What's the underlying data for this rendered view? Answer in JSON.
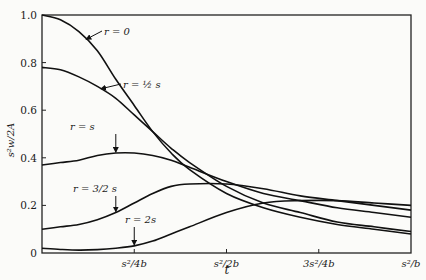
{
  "chart_data": {
    "type": "line",
    "title": "",
    "xlabel": "t",
    "ylabel": "s²w/2A",
    "xlim": [
      0,
      1
    ],
    "ylim": [
      0,
      1.0
    ],
    "x_unit": "s²/b",
    "grid": false,
    "y_ticks": [
      {
        "value": 0,
        "label": "0"
      },
      {
        "value": 0.2,
        "label": "0.2"
      },
      {
        "value": 0.4,
        "label": "0.4"
      },
      {
        "value": 0.6,
        "label": "0.6"
      },
      {
        "value": 0.8,
        "label": "0.8"
      },
      {
        "value": 1.0,
        "label": "1.0"
      }
    ],
    "x_ticks": [
      {
        "value": 0.25,
        "label": "s²/4b"
      },
      {
        "value": 0.5,
        "label": "s²/2b"
      },
      {
        "value": 0.75,
        "label": "3s²/4b"
      },
      {
        "value": 1.0,
        "label": "s²/b"
      }
    ],
    "series": [
      {
        "name": "r = 0",
        "x": [
          0,
          0.05,
          0.1,
          0.15,
          0.2,
          0.25,
          0.3,
          0.35,
          0.4,
          0.5,
          0.6,
          0.7,
          0.8,
          0.9,
          1.0
        ],
        "y": [
          1.0,
          0.98,
          0.93,
          0.85,
          0.73,
          0.62,
          0.51,
          0.42,
          0.35,
          0.25,
          0.19,
          0.15,
          0.12,
          0.1,
          0.08
        ]
      },
      {
        "name": "r = ½s",
        "x": [
          0,
          0.05,
          0.1,
          0.15,
          0.2,
          0.25,
          0.3,
          0.35,
          0.4,
          0.5,
          0.6,
          0.7,
          0.8,
          0.9,
          1.0
        ],
        "y": [
          0.78,
          0.77,
          0.74,
          0.7,
          0.65,
          0.58,
          0.51,
          0.44,
          0.38,
          0.28,
          0.21,
          0.17,
          0.13,
          0.11,
          0.09
        ]
      },
      {
        "name": "r = s",
        "x": [
          0,
          0.05,
          0.1,
          0.15,
          0.2,
          0.25,
          0.3,
          0.35,
          0.4,
          0.5,
          0.6,
          0.7,
          0.8,
          0.9,
          1.0
        ],
        "y": [
          0.37,
          0.38,
          0.39,
          0.41,
          0.42,
          0.42,
          0.41,
          0.39,
          0.36,
          0.3,
          0.25,
          0.22,
          0.19,
          0.17,
          0.15
        ]
      },
      {
        "name": "r = 3/2 s",
        "x": [
          0,
          0.05,
          0.1,
          0.15,
          0.2,
          0.25,
          0.3,
          0.35,
          0.4,
          0.5,
          0.6,
          0.7,
          0.8,
          0.9,
          1.0
        ],
        "y": [
          0.1,
          0.11,
          0.12,
          0.14,
          0.17,
          0.21,
          0.25,
          0.28,
          0.29,
          0.29,
          0.27,
          0.24,
          0.22,
          0.2,
          0.18
        ]
      },
      {
        "name": "r = 2s",
        "x": [
          0,
          0.05,
          0.1,
          0.15,
          0.2,
          0.25,
          0.3,
          0.35,
          0.4,
          0.5,
          0.6,
          0.7,
          0.8,
          0.9,
          1.0
        ],
        "y": [
          0.02,
          0.015,
          0.012,
          0.014,
          0.02,
          0.03,
          0.05,
          0.08,
          0.11,
          0.17,
          0.21,
          0.22,
          0.22,
          0.21,
          0.2
        ]
      }
    ],
    "annotations": [
      {
        "series": 0,
        "label": "r = 0",
        "at_x": 0.12,
        "text_pos": [
          104,
          35
        ],
        "arrow_to_x": 0.12
      },
      {
        "series": 1,
        "label": "r = ½ s",
        "at_x": 0.16,
        "text_pos": [
          123,
          88
        ],
        "arrow_to_x": 0.16
      },
      {
        "series": 2,
        "label": "r = s",
        "at_x": 0.2,
        "text_pos": [
          70,
          130
        ],
        "arrow_to_x": 0.2
      },
      {
        "series": 3,
        "label": "r = 3/2 s",
        "at_x": 0.2,
        "text_pos": [
          73,
          192
        ],
        "arrow_to_x": 0.2
      },
      {
        "series": 4,
        "label": "r = 2s",
        "at_x": 0.25,
        "text_pos": [
          125,
          223
        ],
        "arrow_to_x": 0.25
      }
    ]
  }
}
